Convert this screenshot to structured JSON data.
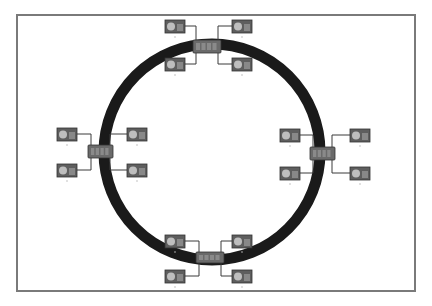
{
  "diagram": {
    "type": "ring-network-topology",
    "ring": {
      "cx": 212,
      "cy": 152,
      "r": 108,
      "stroke_width": 11,
      "color": "#1a1a1a"
    },
    "frame": {
      "border_color": "#7a7a7a"
    },
    "colors": {
      "computer_body": "#5e5e5e",
      "screen_glow": "#cfcfcf",
      "hub": "#6a6a6a",
      "wire": "#3a3a3a"
    },
    "clusters": [
      {
        "name": "top",
        "hub": {
          "x": 193,
          "y": 40,
          "w": 28,
          "h": 13
        },
        "computers": [
          {
            "x": 165,
            "y": 20,
            "label": ""
          },
          {
            "x": 232,
            "y": 20,
            "label": ""
          },
          {
            "x": 165,
            "y": 58,
            "label": ""
          },
          {
            "x": 232,
            "y": 58,
            "label": ""
          }
        ]
      },
      {
        "name": "left",
        "hub": {
          "x": 88,
          "y": 145,
          "w": 25,
          "h": 13
        },
        "computers": [
          {
            "x": 57,
            "y": 128,
            "label": ""
          },
          {
            "x": 127,
            "y": 128,
            "label": ""
          },
          {
            "x": 57,
            "y": 164,
            "label": ""
          },
          {
            "x": 127,
            "y": 164,
            "label": ""
          }
        ]
      },
      {
        "name": "right",
        "hub": {
          "x": 310,
          "y": 147,
          "w": 25,
          "h": 13
        },
        "computers": [
          {
            "x": 280,
            "y": 129,
            "label": ""
          },
          {
            "x": 350,
            "y": 129,
            "label": ""
          },
          {
            "x": 280,
            "y": 167,
            "label": ""
          },
          {
            "x": 350,
            "y": 167,
            "label": ""
          }
        ]
      },
      {
        "name": "bottom",
        "hub": {
          "x": 196,
          "y": 252,
          "w": 28,
          "h": 11
        },
        "computers": [
          {
            "x": 165,
            "y": 235,
            "label": ""
          },
          {
            "x": 232,
            "y": 235,
            "label": ""
          },
          {
            "x": 165,
            "y": 270,
            "label": ""
          },
          {
            "x": 232,
            "y": 270,
            "label": ""
          }
        ]
      }
    ]
  }
}
